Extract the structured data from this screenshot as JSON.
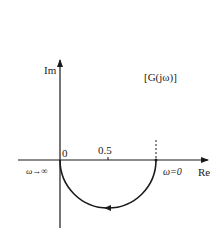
{
  "diagram": {
    "type": "nyquist-plot",
    "title": "[G(jω)]",
    "axes": {
      "imaginary_label": "Im",
      "real_label": "Re",
      "origin_label": "0",
      "tick_label": "0.5"
    },
    "annotations": {
      "omega_infinity": "ω→∞",
      "omega_zero": "ω=0"
    },
    "curve": {
      "shape": "semicircle",
      "center_re": 0.5,
      "radius": 0.5,
      "half": "lower",
      "start": "ω=0 at Re=1",
      "end": "ω→∞ at origin",
      "direction_arrow": "leftward at bottom"
    },
    "colors": {
      "line": "#1a1a1a",
      "background": "#ffffff"
    }
  }
}
